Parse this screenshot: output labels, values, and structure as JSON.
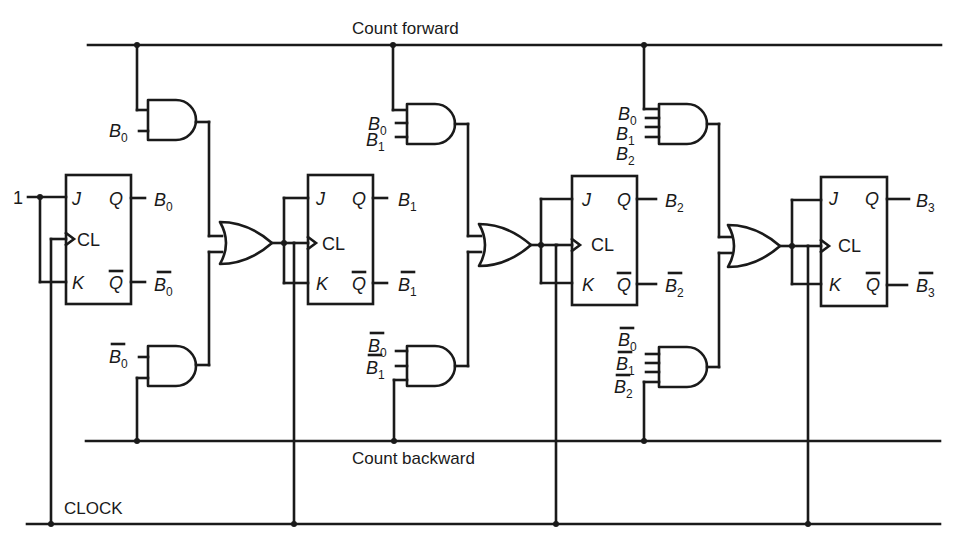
{
  "diagram": {
    "buses": {
      "count_forward": "Count forward",
      "count_backward": "Count backward",
      "clock": "CLOCK"
    },
    "constant_input": "1",
    "flipflops": [
      {
        "id": "ff0",
        "J": "J",
        "K": "K",
        "CL": "CL",
        "Q": "Q",
        "Qbar": "Q",
        "out": "B",
        "out_sub": "0",
        "outbar": "B",
        "outbar_sub": "0"
      },
      {
        "id": "ff1",
        "J": "J",
        "K": "K",
        "CL": "CL",
        "Q": "Q",
        "Qbar": "Q",
        "out": "B",
        "out_sub": "1",
        "outbar": "B",
        "outbar_sub": "1"
      },
      {
        "id": "ff2",
        "J": "J",
        "K": "K",
        "CL": "CL",
        "Q": "Q",
        "Qbar": "Q",
        "out": "B",
        "out_sub": "2",
        "outbar": "B",
        "outbar_sub": "2"
      },
      {
        "id": "ff3",
        "J": "J",
        "K": "K",
        "CL": "CL",
        "Q": "Q",
        "Qbar": "Q",
        "out": "B",
        "out_sub": "3",
        "outbar": "B",
        "outbar_sub": "3"
      }
    ],
    "and_forward": [
      {
        "inputs": [
          {
            "name": "B",
            "sub": "0",
            "bar": false
          }
        ]
      },
      {
        "inputs": [
          {
            "name": "B",
            "sub": "0",
            "bar": false
          },
          {
            "name": "B",
            "sub": "1",
            "bar": false
          }
        ]
      },
      {
        "inputs": [
          {
            "name": "B",
            "sub": "0",
            "bar": false
          },
          {
            "name": "B",
            "sub": "1",
            "bar": false
          },
          {
            "name": "B",
            "sub": "2",
            "bar": false
          }
        ]
      }
    ],
    "and_backward": [
      {
        "inputs": [
          {
            "name": "B",
            "sub": "0",
            "bar": true
          }
        ]
      },
      {
        "inputs": [
          {
            "name": "B",
            "sub": "0",
            "bar": true
          },
          {
            "name": "B",
            "sub": "1",
            "bar": true
          }
        ]
      },
      {
        "inputs": [
          {
            "name": "B",
            "sub": "0",
            "bar": true
          },
          {
            "name": "B",
            "sub": "1",
            "bar": true
          },
          {
            "name": "B",
            "sub": "2",
            "bar": true
          }
        ]
      }
    ],
    "or_gates": 3,
    "colors": {
      "ink": "#1a1a1a",
      "paper": "#ffffff"
    }
  }
}
